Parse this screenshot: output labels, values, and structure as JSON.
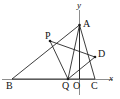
{
  "figure": {
    "kind": "plane-geometry-diagram",
    "width": 120,
    "height": 99,
    "background_color": "#ffffff",
    "line_color": "#1a1a1a",
    "axis_color": "#8d8d8d"
  },
  "axes": {
    "x_axis": {
      "label": "x",
      "label_x": 109,
      "label_y": 74,
      "y": 79,
      "x_start": 2,
      "x_end": 113
    },
    "y_axis": {
      "label": "y",
      "label_x": 77,
      "label_y": 1,
      "x": 79.5,
      "y_start": 10,
      "y_end": 95
    }
  },
  "points": [
    {
      "id": "A",
      "label": "A",
      "x": 79.5,
      "y": 25,
      "label_x": 83,
      "label_y": 19,
      "dot": true
    },
    {
      "id": "P",
      "label": "P",
      "x": 50,
      "y": 41,
      "label_x": 45,
      "label_y": 31,
      "dot": true
    },
    {
      "id": "D",
      "label": "D",
      "x": 95,
      "y": 57,
      "label_x": 98,
      "label_y": 49,
      "dot": true
    },
    {
      "id": "B",
      "label": "B",
      "x": 12,
      "y": 79,
      "label_x": 6,
      "label_y": 81,
      "dot": false
    },
    {
      "id": "Q",
      "label": "Q",
      "x": 68,
      "y": 79,
      "label_x": 62,
      "label_y": 81,
      "dot": true
    },
    {
      "id": "O",
      "label": "O",
      "x": 79.5,
      "y": 79,
      "label_x": 73,
      "label_y": 81,
      "dot": false
    },
    {
      "id": "C",
      "label": "C",
      "x": 95,
      "y": 79,
      "label_x": 91,
      "label_y": 81,
      "dot": false
    }
  ],
  "segments": [
    {
      "id": "BA",
      "from": "B",
      "to": "A",
      "note": "passes through P"
    },
    {
      "id": "AC",
      "from": "A",
      "to": "C",
      "note": "passes through D"
    },
    {
      "id": "BC",
      "from": "B",
      "to": "C",
      "note": "lies along x-axis"
    },
    {
      "id": "AQ",
      "from": "A",
      "to": "Q"
    },
    {
      "id": "AO",
      "from": "A",
      "to": "O",
      "note": "lies along y-axis"
    },
    {
      "id": "PQ",
      "from": "P",
      "to": "Q"
    },
    {
      "id": "PD",
      "from": "P",
      "to": "D"
    },
    {
      "id": "QD",
      "from": "Q",
      "to": "D"
    }
  ]
}
